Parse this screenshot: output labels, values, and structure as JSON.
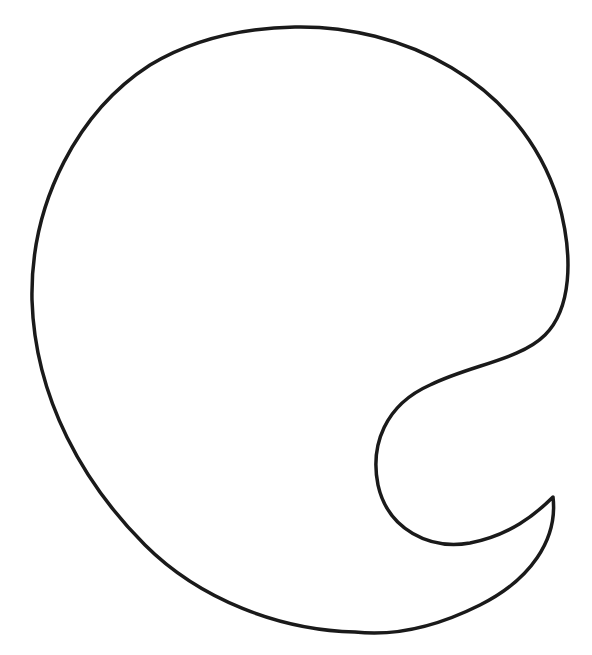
{
  "figure": {
    "stroke_color": "#1a1a1a",
    "background_color": "#ffffff"
  }
}
